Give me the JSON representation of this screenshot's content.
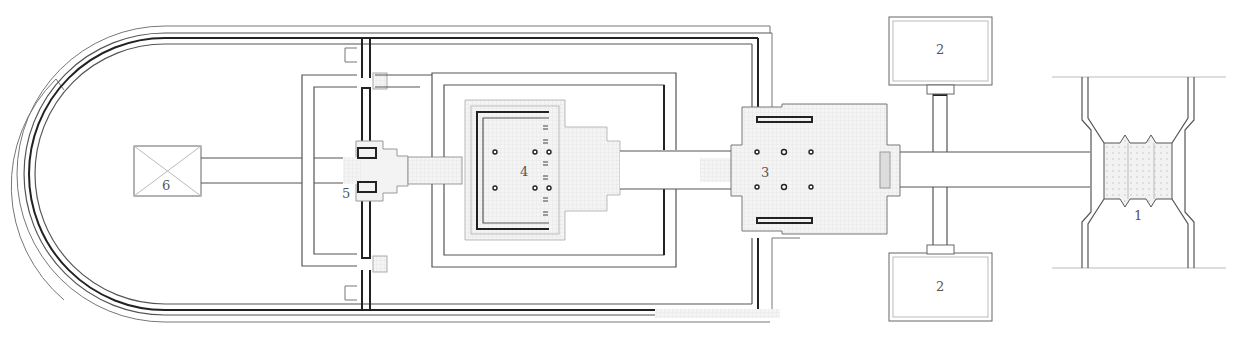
{
  "diagram": {
    "type": "architectural-site-plan",
    "labels": [
      {
        "id": "1",
        "text": "1",
        "x": 1138,
        "y": 218
      },
      {
        "id": "2a",
        "text": "2",
        "x": 940,
        "y": 54
      },
      {
        "id": "2b",
        "text": "2",
        "x": 940,
        "y": 290
      },
      {
        "id": "3",
        "text": "3",
        "x": 765,
        "y": 177
      },
      {
        "id": "4",
        "text": "4",
        "x": 524,
        "y": 175
      },
      {
        "id": "5",
        "text": "5",
        "x": 345,
        "y": 193
      },
      {
        "id": "6",
        "text": "6",
        "x": 166,
        "y": 191
      }
    ],
    "colors": {
      "line": "#555555",
      "heavy_line": "#222222",
      "paving": "#f3f3f3",
      "background": "#ffffff"
    }
  }
}
